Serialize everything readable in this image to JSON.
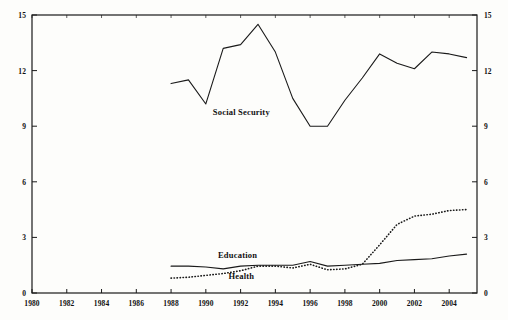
{
  "chart_data": {
    "type": "line",
    "title": "",
    "subtitle": "",
    "xlabel": "",
    "ylabel": "",
    "xlim": [
      1980,
      2005.6
    ],
    "ylim": [
      0,
      15
    ],
    "grid": false,
    "legend_position": "inline-annotations",
    "x_ticks": [
      1980,
      1982,
      1984,
      1986,
      1988,
      1990,
      1992,
      1994,
      1996,
      1998,
      2000,
      2002,
      2004
    ],
    "x_tick_labels": [
      "1980",
      "1982",
      "1984",
      "1986",
      "1988",
      "1990",
      "1992",
      "1994",
      "1996",
      "1998",
      "2000",
      "2002",
      "2004"
    ],
    "y_ticks": [
      0,
      3,
      6,
      9,
      12,
      15
    ],
    "y_tick_labels_left": [
      "0",
      "3",
      "6",
      "9",
      "12",
      "15"
    ],
    "y_tick_labels_right": [
      "0",
      "3",
      "6",
      "9",
      "12",
      "15"
    ],
    "dual_axis": true,
    "series": [
      {
        "name": "Social Security",
        "style": "solid",
        "color": "#1a1a1a",
        "label_x": 1990.4,
        "label_y": 9.7,
        "x": [
          1988,
          1989,
          1990,
          1991,
          1992,
          1993,
          1994,
          1995,
          1996,
          1997,
          1998,
          1999,
          2000,
          2001,
          2002,
          2003,
          2004,
          2005
        ],
        "values": [
          11.3,
          11.5,
          10.2,
          13.2,
          13.4,
          14.5,
          13.0,
          10.5,
          9.0,
          9.0,
          10.4,
          11.6,
          12.9,
          12.4,
          12.1,
          13.0,
          12.9,
          12.7
        ]
      },
      {
        "name": "Education",
        "style": "solid",
        "color": "#1a1a1a",
        "label_x": 1990.7,
        "label_y": 2.0,
        "x": [
          1988,
          1989,
          1990,
          1991,
          1992,
          1993,
          1994,
          1995,
          1996,
          1997,
          1998,
          1999,
          2000,
          2001,
          2002,
          2003,
          2004,
          2005
        ],
        "values": [
          1.45,
          1.45,
          1.4,
          1.3,
          1.45,
          1.5,
          1.5,
          1.5,
          1.7,
          1.45,
          1.5,
          1.55,
          1.6,
          1.75,
          1.8,
          1.85,
          2.0,
          2.1
        ]
      },
      {
        "name": "Health",
        "style": "dotted",
        "color": "#1a1a1a",
        "label_x": 1991.3,
        "label_y": 0.85,
        "x": [
          1988,
          1989,
          1990,
          1991,
          1992,
          1993,
          1994,
          1995,
          1996,
          1997,
          1998,
          1999,
          2000,
          2001,
          2002,
          2003,
          2004,
          2005
        ],
        "values": [
          0.8,
          0.85,
          0.95,
          1.05,
          1.2,
          1.45,
          1.45,
          1.35,
          1.55,
          1.25,
          1.3,
          1.55,
          2.6,
          3.7,
          4.15,
          4.25,
          4.45,
          4.5
        ]
      }
    ]
  },
  "axes": {
    "left_label": "",
    "right_label": ""
  }
}
